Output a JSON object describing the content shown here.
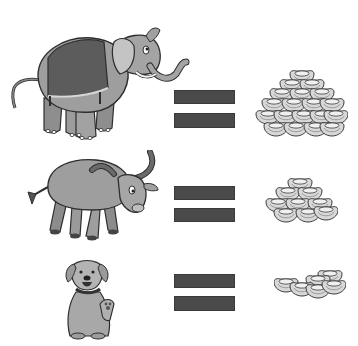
{
  "scene": {
    "description": "Illustration equating animals with piles of gold ingots",
    "rows": [
      {
        "animal": "elephant",
        "equals_icon": "equals-sign",
        "pile": "large-ingot-pile"
      },
      {
        "animal": "water-buffalo",
        "equals_icon": "equals-sign",
        "pile": "medium-ingot-pile"
      },
      {
        "animal": "dog",
        "equals_icon": "equals-sign",
        "pile": "small-ingot-pile"
      }
    ],
    "colors": {
      "background": "#ffffff",
      "equals_bar": "#4a4a4a",
      "animal_body": "#9a9a9a",
      "animal_outline": "#2e2e2e",
      "ingot_fill": "#d6d6d6",
      "ingot_outline": "#3c3c3c"
    }
  }
}
